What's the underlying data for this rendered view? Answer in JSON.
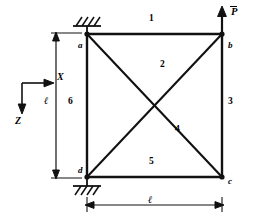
{
  "figure": {
    "type": "truss-diagram",
    "nodes": [
      {
        "id": "a",
        "label": "a",
        "x": 87,
        "y": 34,
        "support": "fixed-hatched-above"
      },
      {
        "id": "b",
        "label": "b",
        "x": 222,
        "y": 34,
        "support": "free",
        "load": "P-bar"
      },
      {
        "id": "c",
        "label": "c",
        "x": 222,
        "y": 177,
        "support": "free"
      },
      {
        "id": "d",
        "label": "d",
        "x": 87,
        "y": 177,
        "support": "fixed-hatched-below"
      }
    ],
    "members": [
      {
        "number": "1",
        "from": "a",
        "to": "b",
        "label_x": 152,
        "label_y": 20
      },
      {
        "number": "2",
        "from": "d",
        "to": "b",
        "label_x": 163,
        "label_y": 66
      },
      {
        "number": "3",
        "from": "b",
        "to": "c",
        "label_x": 230,
        "label_y": 103
      },
      {
        "number": "4",
        "from": "a",
        "to": "c",
        "label_x": 178,
        "label_y": 131
      },
      {
        "number": "5",
        "from": "d",
        "to": "c",
        "label_x": 152,
        "label_y": 163
      },
      {
        "number": "6",
        "from": "a",
        "to": "d",
        "label_x": 71,
        "label_y": 103
      }
    ],
    "load": {
      "symbol": "P",
      "overbar": true,
      "direction": "up",
      "at_node": "b",
      "label_x": 232,
      "label_y": 12
    },
    "dimensions": [
      {
        "name": "height",
        "label": "ℓ",
        "orientation": "vertical",
        "label_x": 47,
        "label_y": 101
      },
      {
        "name": "width",
        "label": "ℓ",
        "orientation": "horizontal",
        "label_x": 151,
        "label_y": 200
      }
    ],
    "axes": {
      "origin_x": 22,
      "origin_y": 83,
      "x_axis": {
        "label": "X",
        "direction": "right",
        "label_x": 57,
        "label_y": 78
      },
      "z_axis": {
        "label": "Z",
        "direction": "down",
        "label_x": 16,
        "label_y": 121
      }
    },
    "colors": {
      "stroke": "#000000",
      "background": "#ffffff"
    }
  }
}
